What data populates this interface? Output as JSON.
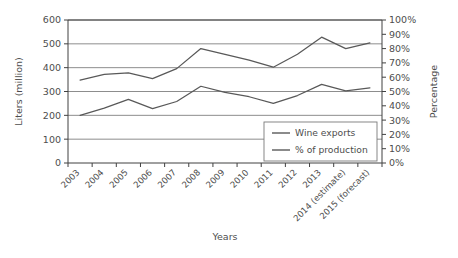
{
  "chart_data": {
    "type": "line",
    "title": "",
    "categories": [
      "2003",
      "2004",
      "2005",
      "2006",
      "2007",
      "2008",
      "2009",
      "2010",
      "2011",
      "2012",
      "2013",
      "2014 (estimate)",
      "2015 (forecast)"
    ],
    "xlabel": "Years",
    "ylabel": "Liters (million)",
    "y2label": "Percentage",
    "ylim": [
      0,
      600
    ],
    "y2lim": [
      0,
      100
    ],
    "yticks": [
      "0",
      "100",
      "200",
      "300",
      "400",
      "500",
      "600"
    ],
    "y2ticks": [
      "0%",
      "10%",
      "20%",
      "30%",
      "40%",
      "50%",
      "60%",
      "70%",
      "80%",
      "90%",
      "100%"
    ],
    "grid": true,
    "legend_position": "inside-lower-right",
    "series": [
      {
        "name": "Wine exports",
        "axis": "left",
        "units": "million liters",
        "color": "#595959",
        "values": [
          200,
          230,
          267,
          228,
          258,
          322,
          296,
          278,
          250,
          283,
          330,
          303,
          315
        ]
      },
      {
        "name": "% of production",
        "axis": "right",
        "units": "percent",
        "color": "#595959",
        "values": [
          58,
          62,
          63,
          59,
          66,
          80,
          76,
          72,
          67,
          76,
          88,
          80,
          84
        ]
      }
    ]
  }
}
